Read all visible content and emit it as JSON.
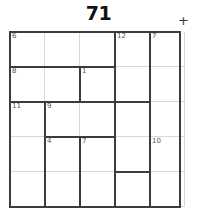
{
  "header": {
    "title": "71",
    "operation_badge": "+",
    "operation_icon": "plus-icon"
  },
  "grid": {
    "rows": 5,
    "cols": 5,
    "cell_size": 35,
    "origin": {
      "x": 10,
      "y": 32
    },
    "line_color": "#d8d8d8",
    "cage_color": "#3c3c3c",
    "cells": [
      {
        "r": 0,
        "c": 0,
        "clue": "6",
        "value": ""
      },
      {
        "r": 0,
        "c": 1,
        "clue": "",
        "value": ""
      },
      {
        "r": 0,
        "c": 2,
        "clue": "",
        "value": ""
      },
      {
        "r": 0,
        "c": 3,
        "clue": "12",
        "value": ""
      },
      {
        "r": 0,
        "c": 4,
        "clue": "7",
        "value": ""
      },
      {
        "r": 1,
        "c": 0,
        "clue": "8",
        "value": ""
      },
      {
        "r": 1,
        "c": 1,
        "clue": "",
        "value": ""
      },
      {
        "r": 1,
        "c": 2,
        "clue": "1",
        "value": ""
      },
      {
        "r": 1,
        "c": 3,
        "clue": "",
        "value": ""
      },
      {
        "r": 1,
        "c": 4,
        "clue": "",
        "value": ""
      },
      {
        "r": 2,
        "c": 0,
        "clue": "11",
        "value": ""
      },
      {
        "r": 2,
        "c": 1,
        "clue": "9",
        "value": ""
      },
      {
        "r": 2,
        "c": 2,
        "clue": "",
        "value": ""
      },
      {
        "r": 2,
        "c": 3,
        "clue": "",
        "value": ""
      },
      {
        "r": 2,
        "c": 4,
        "clue": "",
        "value": ""
      },
      {
        "r": 3,
        "c": 0,
        "clue": "",
        "value": ""
      },
      {
        "r": 3,
        "c": 1,
        "clue": "4",
        "value": ""
      },
      {
        "r": 3,
        "c": 2,
        "clue": "7",
        "value": ""
      },
      {
        "r": 3,
        "c": 3,
        "clue": "",
        "value": ""
      },
      {
        "r": 3,
        "c": 4,
        "clue": "10",
        "value": ""
      },
      {
        "r": 4,
        "c": 0,
        "clue": "",
        "value": ""
      },
      {
        "r": 4,
        "c": 1,
        "clue": "",
        "value": ""
      },
      {
        "r": 4,
        "c": 2,
        "clue": "",
        "value": ""
      },
      {
        "r": 4,
        "c": 3,
        "clue": "",
        "value": ""
      },
      {
        "r": 4,
        "c": 4,
        "clue": "",
        "value": ""
      }
    ],
    "cage_clues": [
      "6",
      "12",
      "7",
      "8",
      "1",
      "11",
      "9",
      "4",
      "7",
      "10"
    ],
    "cage_edges": {
      "horizontal": [
        {
          "r": 1,
          "c": 0,
          "len": 3
        },
        {
          "r": 2,
          "c": 0,
          "len": 1
        },
        {
          "r": 2,
          "c": 1,
          "len": 2
        },
        {
          "r": 2,
          "c": 3,
          "len": 1
        },
        {
          "r": 3,
          "c": 1,
          "len": 2
        },
        {
          "r": 4,
          "c": 3,
          "len": 1
        }
      ],
      "vertical": [
        {
          "r": 0,
          "c": 3,
          "len": 3
        },
        {
          "r": 0,
          "c": 4,
          "len": 5
        },
        {
          "r": 1,
          "c": 2,
          "len": 1
        },
        {
          "r": 1,
          "c": 3,
          "len": 3
        },
        {
          "r": 2,
          "c": 1,
          "len": 3
        },
        {
          "r": 3,
          "c": 2,
          "len": 2
        },
        {
          "r": 3,
          "c": 4,
          "len": 1
        },
        {
          "r": 4,
          "c": 3,
          "len": 1
        }
      ]
    }
  }
}
